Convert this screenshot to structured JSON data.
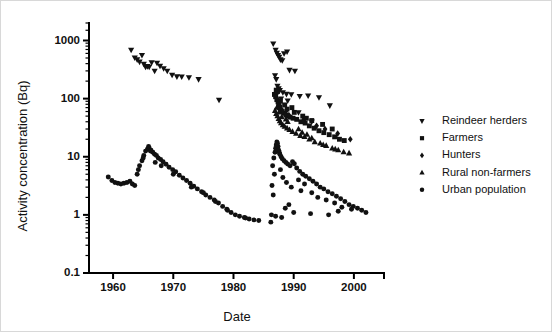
{
  "figure": {
    "background": "#ffffff",
    "foreground": "#111111",
    "border_color": "#d8d8d8"
  },
  "chart_data": {
    "type": "scatter",
    "title": "",
    "xlabel": "Date",
    "ylabel": "Activity concentration (Bq)",
    "xlim": [
      1956,
      2005
    ],
    "ylim": [
      0.1,
      2000
    ],
    "yscale": "log",
    "xscale": "linear",
    "grid": false,
    "legend_position": "right",
    "xticks": [
      1960,
      1970,
      1980,
      1990,
      2000
    ],
    "xtick_labels": [
      "1960",
      "1970",
      "1980",
      "1990",
      "2000"
    ],
    "yticks": [
      0.1,
      1,
      10,
      100,
      1000
    ],
    "ytick_labels": [
      "0.1",
      "1",
      "10",
      "100",
      "1000"
    ],
    "series": [
      {
        "name": "Reindeer herders",
        "marker": "triangle-down",
        "color": "#111111",
        "points": [
          [
            1963.0,
            690
          ],
          [
            1963.6,
            505
          ],
          [
            1964.0,
            470
          ],
          [
            1964.4,
            430
          ],
          [
            1964.8,
            560
          ],
          [
            1965.1,
            395
          ],
          [
            1965.4,
            350
          ],
          [
            1965.7,
            360
          ],
          [
            1966.0,
            352
          ],
          [
            1966.4,
            420
          ],
          [
            1966.9,
            300
          ],
          [
            1967.3,
            410
          ],
          [
            1967.8,
            365
          ],
          [
            1968.4,
            330
          ],
          [
            1969.0,
            300
          ],
          [
            1969.8,
            255
          ],
          [
            1970.6,
            240
          ],
          [
            1971.4,
            238
          ],
          [
            1972.6,
            232
          ],
          [
            1974.2,
            215
          ],
          [
            1977.6,
            95
          ],
          [
            1986.6,
            880
          ],
          [
            1987.0,
            690
          ],
          [
            1987.2,
            610
          ],
          [
            1987.4,
            560
          ],
          [
            1987.6,
            520
          ],
          [
            1987.8,
            470
          ],
          [
            1988.1,
            455
          ],
          [
            1988.4,
            600
          ],
          [
            1988.9,
            640
          ],
          [
            1989.3,
            310
          ],
          [
            1990.2,
            300
          ],
          [
            1986.9,
            250
          ],
          [
            1987.1,
            215
          ],
          [
            1987.3,
            165
          ],
          [
            1987.5,
            150
          ],
          [
            1987.7,
            140
          ],
          [
            1988.2,
            128
          ],
          [
            1988.8,
            120
          ],
          [
            1989.6,
            118
          ],
          [
            1991.0,
            110
          ],
          [
            1992.4,
            112
          ],
          [
            1994.2,
            105
          ],
          [
            1996.0,
            76
          ],
          [
            1990.8,
            58
          ],
          [
            1987.2,
            120
          ],
          [
            1987.9,
            100
          ],
          [
            1989.0,
            92
          ],
          [
            1991.8,
            44
          ],
          [
            1993.0,
            40
          ],
          [
            1987.6,
            64
          ],
          [
            1988.6,
            56
          ]
        ]
      },
      {
        "name": "Farmers",
        "marker": "square",
        "color": "#111111",
        "points": [
          [
            1986.8,
            118
          ],
          [
            1987.0,
            108
          ],
          [
            1987.2,
            96
          ],
          [
            1987.4,
            88
          ],
          [
            1987.5,
            80
          ],
          [
            1987.7,
            72
          ],
          [
            1987.9,
            64
          ],
          [
            1988.1,
            60
          ],
          [
            1988.4,
            56
          ],
          [
            1988.7,
            52
          ],
          [
            1989.0,
            50
          ],
          [
            1989.4,
            48
          ],
          [
            1989.9,
            46
          ],
          [
            1990.5,
            44
          ],
          [
            1991.2,
            40
          ],
          [
            1991.9,
            38
          ],
          [
            1992.6,
            34
          ],
          [
            1993.4,
            31
          ],
          [
            1994.2,
            28
          ],
          [
            1995.0,
            26
          ],
          [
            1995.9,
            24
          ],
          [
            1996.8,
            22
          ],
          [
            1997.6,
            20
          ],
          [
            1998.4,
            19
          ],
          [
            1987.1,
            140
          ],
          [
            1987.3,
            132
          ],
          [
            1988.9,
            66
          ],
          [
            1990.1,
            58
          ],
          [
            1991.5,
            50
          ],
          [
            1993.0,
            42
          ],
          [
            1994.8,
            36
          ],
          [
            1996.4,
            30
          ],
          [
            1987.8,
            90
          ],
          [
            1988.5,
            78
          ],
          [
            1989.7,
            70
          ],
          [
            1992.1,
            46
          ]
        ]
      },
      {
        "name": "Hunters",
        "marker": "diamond",
        "color": "#111111",
        "points": [
          [
            1997.3,
            25
          ],
          [
            1999.4,
            20
          ],
          [
            1995.2,
            30
          ],
          [
            1993.8,
            34
          ],
          [
            1991.6,
            42
          ],
          [
            1989.2,
            52
          ]
        ]
      },
      {
        "name": "Rural non-farmers",
        "marker": "triangle-up",
        "color": "#111111",
        "points": [
          [
            1986.9,
            62
          ],
          [
            1987.1,
            55
          ],
          [
            1987.3,
            50
          ],
          [
            1987.5,
            45
          ],
          [
            1987.7,
            41
          ],
          [
            1987.9,
            38
          ],
          [
            1988.2,
            35
          ],
          [
            1988.5,
            33
          ],
          [
            1988.9,
            31
          ],
          [
            1989.3,
            29
          ],
          [
            1989.8,
            27
          ],
          [
            1990.4,
            25
          ],
          [
            1991.1,
            23
          ],
          [
            1991.8,
            22
          ],
          [
            1992.6,
            20
          ],
          [
            1993.5,
            18
          ],
          [
            1994.4,
            17
          ],
          [
            1995.4,
            15.5
          ],
          [
            1996.4,
            14
          ],
          [
            1997.4,
            13
          ],
          [
            1998.3,
            12
          ],
          [
            1999.2,
            11.5
          ],
          [
            1987.2,
            70
          ],
          [
            1988.0,
            48
          ],
          [
            1989.0,
            40
          ],
          [
            1990.8,
            30
          ],
          [
            1992.2,
            24
          ],
          [
            1993.0,
            21
          ],
          [
            1994.9,
            16
          ],
          [
            1996.9,
            13.5
          ],
          [
            1987.6,
            58
          ],
          [
            1988.7,
            44
          ],
          [
            1991.4,
            26
          ]
        ]
      },
      {
        "name": "Urban population",
        "marker": "circle",
        "color": "#111111",
        "points": [
          [
            1959.2,
            4.5
          ],
          [
            1959.8,
            3.9
          ],
          [
            1960.3,
            3.6
          ],
          [
            1960.8,
            3.5
          ],
          [
            1961.3,
            3.4
          ],
          [
            1961.8,
            3.5
          ],
          [
            1962.3,
            3.6
          ],
          [
            1962.8,
            3.8
          ],
          [
            1963.2,
            3.4
          ],
          [
            1963.6,
            3.2
          ],
          [
            1964.0,
            5.0
          ],
          [
            1964.4,
            7.0
          ],
          [
            1964.8,
            8.5
          ],
          [
            1965.1,
            10.5
          ],
          [
            1965.4,
            12.5
          ],
          [
            1965.7,
            13.5
          ],
          [
            1966.0,
            14.0
          ],
          [
            1966.3,
            13.0
          ],
          [
            1966.6,
            12.0
          ],
          [
            1966.9,
            11.0
          ],
          [
            1967.2,
            10.5
          ],
          [
            1967.5,
            9.5
          ],
          [
            1967.9,
            9.0
          ],
          [
            1968.3,
            8.2
          ],
          [
            1968.8,
            7.4
          ],
          [
            1969.3,
            6.6
          ],
          [
            1969.9,
            6.0
          ],
          [
            1970.4,
            5.5
          ],
          [
            1971.0,
            4.8
          ],
          [
            1971.6,
            4.3
          ],
          [
            1972.2,
            3.9
          ],
          [
            1972.8,
            3.5
          ],
          [
            1973.4,
            3.1
          ],
          [
            1974.0,
            2.8
          ],
          [
            1974.7,
            2.5
          ],
          [
            1975.4,
            2.2
          ],
          [
            1976.1,
            2.0
          ],
          [
            1976.8,
            1.8
          ],
          [
            1977.5,
            1.6
          ],
          [
            1978.2,
            1.4
          ],
          [
            1978.9,
            1.25
          ],
          [
            1979.6,
            1.1
          ],
          [
            1980.3,
            1.0
          ],
          [
            1981.0,
            0.95
          ],
          [
            1981.8,
            0.9
          ],
          [
            1982.6,
            0.85
          ],
          [
            1983.4,
            0.82
          ],
          [
            1984.2,
            0.8
          ],
          [
            1964.2,
            6.0
          ],
          [
            1965.0,
            9.5
          ],
          [
            1965.9,
            15.0
          ],
          [
            1966.2,
            12.5
          ],
          [
            1967.0,
            8.0
          ],
          [
            1968.0,
            7.0
          ],
          [
            1970.0,
            5.0
          ],
          [
            1973.0,
            3.0
          ],
          [
            1975.0,
            2.4
          ],
          [
            1977.0,
            1.7
          ],
          [
            1979.0,
            1.2
          ],
          [
            1982.0,
            0.88
          ],
          [
            1986.5,
            7.0
          ],
          [
            1986.7,
            9.5
          ],
          [
            1986.9,
            12.0
          ],
          [
            1987.0,
            14.0
          ],
          [
            1987.1,
            16.0
          ],
          [
            1987.2,
            18.0
          ],
          [
            1987.3,
            17.0
          ],
          [
            1987.4,
            15.0
          ],
          [
            1987.5,
            13.0
          ],
          [
            1987.6,
            12.0
          ],
          [
            1987.7,
            11.0
          ],
          [
            1987.9,
            10.0
          ],
          [
            1988.1,
            9.2
          ],
          [
            1988.4,
            8.5
          ],
          [
            1988.7,
            8.0
          ],
          [
            1989.0,
            7.5
          ],
          [
            1989.4,
            7.0
          ],
          [
            1989.8,
            8.2
          ],
          [
            1990.1,
            7.6
          ],
          [
            1990.5,
            6.4
          ],
          [
            1991.0,
            5.6
          ],
          [
            1991.5,
            5.0
          ],
          [
            1992.0,
            4.6
          ],
          [
            1992.6,
            4.2
          ],
          [
            1993.2,
            3.8
          ],
          [
            1993.8,
            3.4
          ],
          [
            1994.4,
            3.0
          ],
          [
            1995.0,
            2.8
          ],
          [
            1995.7,
            2.5
          ],
          [
            1996.4,
            2.3
          ],
          [
            1997.1,
            2.1
          ],
          [
            1997.8,
            1.9
          ],
          [
            1998.5,
            1.7
          ],
          [
            1999.2,
            1.5
          ],
          [
            1999.9,
            1.4
          ],
          [
            2000.6,
            1.3
          ],
          [
            2001.3,
            1.2
          ],
          [
            2002.0,
            1.1
          ],
          [
            1986.4,
            3.2
          ],
          [
            1986.6,
            2.2
          ],
          [
            1986.8,
            5.0
          ],
          [
            1987.8,
            6.0
          ],
          [
            1988.2,
            4.4
          ],
          [
            1988.8,
            3.6
          ],
          [
            1989.6,
            3.0
          ],
          [
            1990.8,
            4.0
          ],
          [
            1991.8,
            3.4
          ],
          [
            1993.0,
            2.4
          ],
          [
            1994.0,
            2.0
          ],
          [
            1995.4,
            1.8
          ],
          [
            1996.8,
            1.6
          ],
          [
            1998.0,
            1.35
          ],
          [
            1999.6,
            1.25
          ],
          [
            1986.3,
            1.0
          ],
          [
            1987.0,
            0.95
          ],
          [
            1988.0,
            0.9
          ],
          [
            1989.2,
            1.5
          ],
          [
            1990.0,
            1.1
          ],
          [
            1992.8,
            1.05
          ],
          [
            1995.8,
            1.0
          ],
          [
            1997.4,
            1.15
          ],
          [
            1986.2,
            0.75
          ],
          [
            1988.6,
            1.3
          ],
          [
            1991.2,
            2.6
          ]
        ]
      }
    ]
  },
  "legend": {
    "items": [
      {
        "label": "Reindeer herders",
        "marker": "triangle-down"
      },
      {
        "label": "Farmers",
        "marker": "square"
      },
      {
        "label": "Hunters",
        "marker": "diamond"
      },
      {
        "label": "Rural non-farmers",
        "marker": "triangle-up"
      },
      {
        "label": "Urban population",
        "marker": "circle"
      }
    ]
  }
}
